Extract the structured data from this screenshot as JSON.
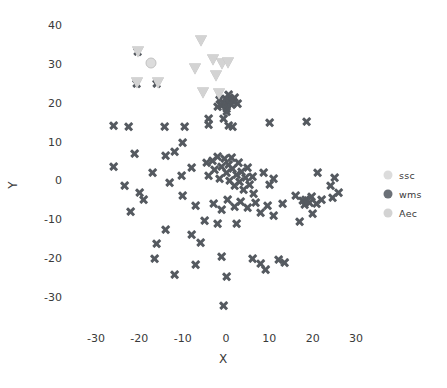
{
  "chart_data": {
    "type": "scatter",
    "title": "",
    "xlabel": "X",
    "ylabel": "Y",
    "xlim": [
      -34,
      34
    ],
    "ylim": [
      -36,
      42
    ],
    "xticks": [
      "-30",
      "-20",
      "-10",
      "0",
      "10",
      "20",
      "30"
    ],
    "xtick_values": [
      -30,
      -20,
      -10,
      0,
      10,
      20,
      30
    ],
    "yticks": [
      "40",
      "30",
      "20",
      "10",
      "0",
      "-10",
      "-20",
      "-30"
    ],
    "ytick_values": [
      40,
      30,
      20,
      10,
      0,
      -10,
      -20,
      -30
    ],
    "grid": false,
    "legend_position": "right",
    "colors": {
      "ssc": "#dcdcdc",
      "wms": "#555a60",
      "Aec": "#d3d3d3",
      "axis_text": "#3a3a3a",
      "background": "#ffffff"
    },
    "series": [
      {
        "name": "ssc",
        "marker": "circle",
        "color": "#dcdcdc",
        "points": [
          [
            -17.2,
            30.2
          ]
        ]
      },
      {
        "name": "wms",
        "marker": "x",
        "color": "#555a60",
        "points": [
          [
            -20.4,
            33.2
          ],
          [
            -20.6,
            25.0
          ],
          [
            -16.0,
            25.0
          ],
          [
            -22.5,
            14.0
          ],
          [
            -14.2,
            13.8
          ],
          [
            -9.6,
            14.0
          ],
          [
            -4.0,
            14.4
          ],
          [
            0.5,
            14.2
          ],
          [
            1.6,
            14.0
          ],
          [
            10.0,
            15.0
          ],
          [
            -26.0,
            3.6
          ],
          [
            -21.2,
            7.0
          ],
          [
            -14.0,
            6.4
          ],
          [
            -12.0,
            7.4
          ],
          [
            -17.0,
            2.0
          ],
          [
            -23.5,
            -1.2
          ],
          [
            -20.0,
            -3.0
          ],
          [
            -13.0,
            -0.6
          ],
          [
            -10.2,
            1.2
          ],
          [
            -10.0,
            -4.0
          ],
          [
            -8.0,
            3.4
          ],
          [
            -4.6,
            4.6
          ],
          [
            -4.0,
            1.2
          ],
          [
            -3.2,
            5.2
          ],
          [
            -2.6,
            2.8
          ],
          [
            -2.0,
            6.2
          ],
          [
            -1.4,
            0.4
          ],
          [
            -1.0,
            3.6
          ],
          [
            -0.4,
            5.6
          ],
          [
            0.2,
            2.0
          ],
          [
            0.6,
            4.2
          ],
          [
            0.8,
            0.0
          ],
          [
            1.2,
            6.0
          ],
          [
            1.6,
            3.0
          ],
          [
            2.0,
            -1.2
          ],
          [
            2.4,
            1.4
          ],
          [
            2.8,
            4.6
          ],
          [
            3.2,
            -0.2
          ],
          [
            3.6,
            2.2
          ],
          [
            4.0,
            -2.4
          ],
          [
            4.4,
            0.8
          ],
          [
            5.0,
            3.2
          ],
          [
            5.4,
            -1.0
          ],
          [
            6.0,
            1.0
          ],
          [
            6.4,
            -3.4
          ],
          [
            0.0,
            19.6
          ],
          [
            0.4,
            20.4
          ],
          [
            -0.6,
            20.0
          ],
          [
            0.8,
            21.0
          ],
          [
            -0.2,
            21.2
          ],
          [
            1.2,
            19.6
          ],
          [
            -1.0,
            19.2
          ],
          [
            0.2,
            18.6
          ],
          [
            0.6,
            22.0
          ],
          [
            1.6,
            20.6
          ],
          [
            -1.4,
            20.8
          ],
          [
            2.0,
            21.4
          ],
          [
            -2.0,
            19.0
          ],
          [
            2.6,
            19.8
          ],
          [
            0.0,
            17.8
          ],
          [
            -4.0,
            16.0
          ],
          [
            -0.6,
            16.0
          ],
          [
            -14.0,
            -12.6
          ],
          [
            -7.0,
            -6.4
          ],
          [
            -3.0,
            -6.0
          ],
          [
            -1.0,
            -7.6
          ],
          [
            0.4,
            -5.0
          ],
          [
            2.0,
            -6.8
          ],
          [
            3.4,
            -5.4
          ],
          [
            5.0,
            -7.0
          ],
          [
            6.8,
            -5.6
          ],
          [
            8.0,
            -8.2
          ],
          [
            9.6,
            -6.4
          ],
          [
            11.0,
            -9.0
          ],
          [
            13.0,
            -6.0
          ],
          [
            16.0,
            -4.0
          ],
          [
            17.6,
            -5.2
          ],
          [
            18.4,
            -4.8
          ],
          [
            19.2,
            -5.6
          ],
          [
            18.0,
            -6.2
          ],
          [
            19.8,
            -4.2
          ],
          [
            20.8,
            -6.0
          ],
          [
            22.0,
            -5.0
          ],
          [
            24.6,
            -4.4
          ],
          [
            24.0,
            -1.2
          ],
          [
            26.0,
            -3.0
          ],
          [
            20.0,
            -8.4
          ],
          [
            17.0,
            -10.6
          ],
          [
            -16.0,
            -16.2
          ],
          [
            -16.4,
            -20.2
          ],
          [
            -12.0,
            -24.2
          ],
          [
            -7.0,
            -21.6
          ],
          [
            -1.0,
            -19.6
          ],
          [
            0.0,
            -24.6
          ],
          [
            -0.6,
            -32.2
          ],
          [
            6.0,
            -20.0
          ],
          [
            8.0,
            -21.4
          ],
          [
            9.0,
            -23.0
          ],
          [
            12.0,
            -20.4
          ],
          [
            13.4,
            -21.0
          ],
          [
            -2.0,
            -11.0
          ],
          [
            -5.0,
            -10.4
          ],
          [
            2.4,
            -11.2
          ],
          [
            10.0,
            -1.0
          ],
          [
            11.0,
            0.4
          ],
          [
            8.6,
            2.0
          ],
          [
            18.6,
            15.2
          ],
          [
            21.0,
            2.0
          ],
          [
            25.0,
            0.8
          ],
          [
            -26.0,
            14.2
          ],
          [
            -22.0,
            -8.0
          ],
          [
            -19.0,
            -5.0
          ],
          [
            -8.0,
            -14.0
          ],
          [
            -6.0,
            -16.0
          ],
          [
            -10.0,
            9.8
          ]
        ]
      },
      {
        "name": "Aec",
        "marker": "triangle-down",
        "color": "#d3d3d3",
        "points": [
          [
            -20.2,
            33.0
          ],
          [
            -20.6,
            25.0
          ],
          [
            -15.8,
            25.0
          ],
          [
            -5.8,
            36.0
          ],
          [
            -3.0,
            31.0
          ],
          [
            -1.0,
            30.0
          ],
          [
            0.4,
            30.2
          ],
          [
            -7.2,
            28.6
          ],
          [
            -2.2,
            27.0
          ],
          [
            -5.4,
            22.6
          ],
          [
            -1.6,
            22.2
          ]
        ]
      }
    ],
    "legend": [
      {
        "label": "ssc",
        "marker": "circle",
        "color": "#dcdcdc"
      },
      {
        "label": "wms",
        "marker": "circle",
        "color": "#6b7077"
      },
      {
        "label": "Aec",
        "marker": "circle",
        "color": "#d3d3d3"
      }
    ]
  }
}
